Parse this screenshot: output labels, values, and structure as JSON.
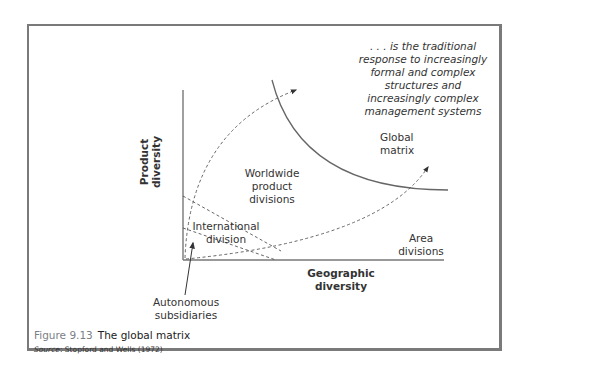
{
  "figure": {
    "number": "Figure 9.13",
    "title": "The global matrix",
    "source_label": "Source",
    "source_text": ": Stopford and Wells (1972)"
  },
  "axes": {
    "x_label_line1": "Geographic",
    "x_label_line2": "diversity",
    "y_label_line1": "Product",
    "y_label_line2": "diversity"
  },
  "regions": {
    "global_matrix": [
      "Global",
      "matrix"
    ],
    "worldwide_product_divisions": [
      "Worldwide",
      "product",
      "divisions"
    ],
    "international_division": [
      "International",
      "division"
    ],
    "area_divisions": [
      "Area",
      "divisions"
    ],
    "autonomous_subsidiaries": [
      "Autonomous",
      "subsidiaries"
    ]
  },
  "annotation": {
    "lines": [
      ". . . is the traditional",
      "response to increasingly",
      "formal and complex",
      "structures and",
      "increasingly complex",
      "management systems"
    ]
  },
  "colors": {
    "frame_border": "#7a7a7a",
    "line": "#555555",
    "figure_number": "#7b7f86"
  }
}
